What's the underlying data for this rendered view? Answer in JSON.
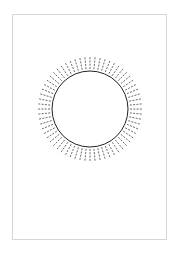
{
  "page": {
    "border_color": "#d6d6d6",
    "background": "#ffffff"
  },
  "figure": {
    "type": "circle-with-radial-ticks",
    "center": [
      90,
      109
    ],
    "circle_radius": 38,
    "tick_inner_radius": 40,
    "tick_outer_radius": 53,
    "tick_count": 64,
    "tick_style": "dashed",
    "circle_color": "#222222",
    "tick_color": "#444444"
  }
}
